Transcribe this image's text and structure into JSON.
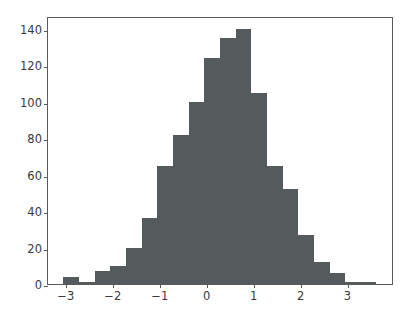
{
  "chart_data": {
    "type": "bar",
    "title": "",
    "xlabel": "",
    "ylabel": "",
    "grid": false,
    "legend": null,
    "xlim": [
      -3.38,
      3.99
    ],
    "ylim": [
      0,
      147
    ],
    "xticks": [
      -3,
      -2,
      -1,
      0,
      1,
      2,
      3
    ],
    "xticklabels": [
      "−3",
      "−2",
      "−1",
      "0",
      "1",
      "2",
      "3"
    ],
    "yticks": [
      0,
      20,
      40,
      60,
      80,
      100,
      120,
      140
    ],
    "yticklabels": [
      "0",
      "20",
      "40",
      "60",
      "80",
      "100",
      "120",
      "140"
    ],
    "bin_width": 0.3333,
    "bin_edges": [
      -3.05,
      -2.717,
      -2.383,
      -2.05,
      -1.717,
      -1.383,
      -1.05,
      -0.717,
      -0.383,
      -0.05,
      0.283,
      0.617,
      0.95,
      1.283,
      1.617,
      1.95,
      2.283,
      2.617,
      2.95,
      3.283,
      3.617
    ],
    "bin_centers": [
      -2.883,
      -2.55,
      -2.217,
      -1.883,
      -1.55,
      -1.217,
      -0.883,
      -0.55,
      -0.217,
      0.117,
      0.45,
      0.783,
      1.117,
      1.45,
      1.783,
      2.117,
      2.45,
      2.783,
      3.117,
      3.45
    ],
    "categories": [
      "-2.88",
      "-2.55",
      "-2.22",
      "-1.88",
      "-1.55",
      "-1.22",
      "-0.88",
      "-0.55",
      "-0.22",
      "0.12",
      "0.45",
      "0.78",
      "1.12",
      "1.45",
      "1.78",
      "2.12",
      "2.45",
      "2.78",
      "3.12",
      "3.45"
    ],
    "values": [
      4,
      1,
      7,
      10,
      20,
      36,
      65,
      82,
      100,
      124,
      135,
      140,
      105,
      65,
      52,
      27,
      12,
      6,
      1,
      1
    ],
    "bar_color": "#555a5c",
    "axis_color": "#5a5a5a",
    "background": "#ffffff"
  }
}
